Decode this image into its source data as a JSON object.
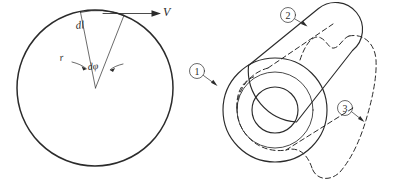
{
  "figure": {
    "background_color": "#ffffff",
    "ink_color": "#2b2b2b"
  },
  "left_diagram": {
    "name": "rotating-disc-sector",
    "description": "Large circle with a narrow radial sector drawn from the centre to the top of the arc",
    "labels": {
      "arc_element": "dl",
      "radius": "r",
      "angle": "dφ",
      "velocity": "V"
    },
    "geometry": {
      "center_x": 95,
      "center_y": 88,
      "radius": 78,
      "sector_half_angle_deg": 11
    }
  },
  "right_diagram": {
    "name": "offset-lever-outline",
    "description": "Lever / connecting link with circular boss and bore, shown in a solid position and a dashed displaced position",
    "callouts": [
      {
        "id": "callout-1",
        "label": "1",
        "target": "solid boss outline"
      },
      {
        "id": "callout-2",
        "label": "2",
        "target": "solid lever outline"
      },
      {
        "id": "callout-3",
        "label": "3",
        "target": "dashed displaced outline"
      }
    ],
    "geometry": {
      "boss_center_x": 275,
      "boss_center_y": 110,
      "boss_radius": 52,
      "hub_radius": 38,
      "bore_radius": 23
    }
  }
}
